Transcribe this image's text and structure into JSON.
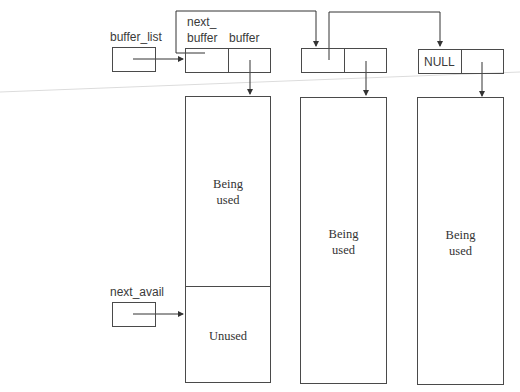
{
  "labels": {
    "buffer_list": "buffer_list",
    "next_buffer_line1": "next_",
    "next_buffer_line2": "buffer",
    "buffer": "buffer",
    "null_value": "NULL",
    "next_avail": "next_avail"
  },
  "buffers": [
    {
      "used_line1": "Being",
      "used_line2": "used",
      "unused": "Unused"
    },
    {
      "used_line1": "Being",
      "used_line2": "used"
    },
    {
      "used_line1": "Being",
      "used_line2": "used"
    }
  ],
  "colors": {
    "line": "#4a4a4a",
    "text": "#333333",
    "artifact": "#d8d8d8"
  }
}
